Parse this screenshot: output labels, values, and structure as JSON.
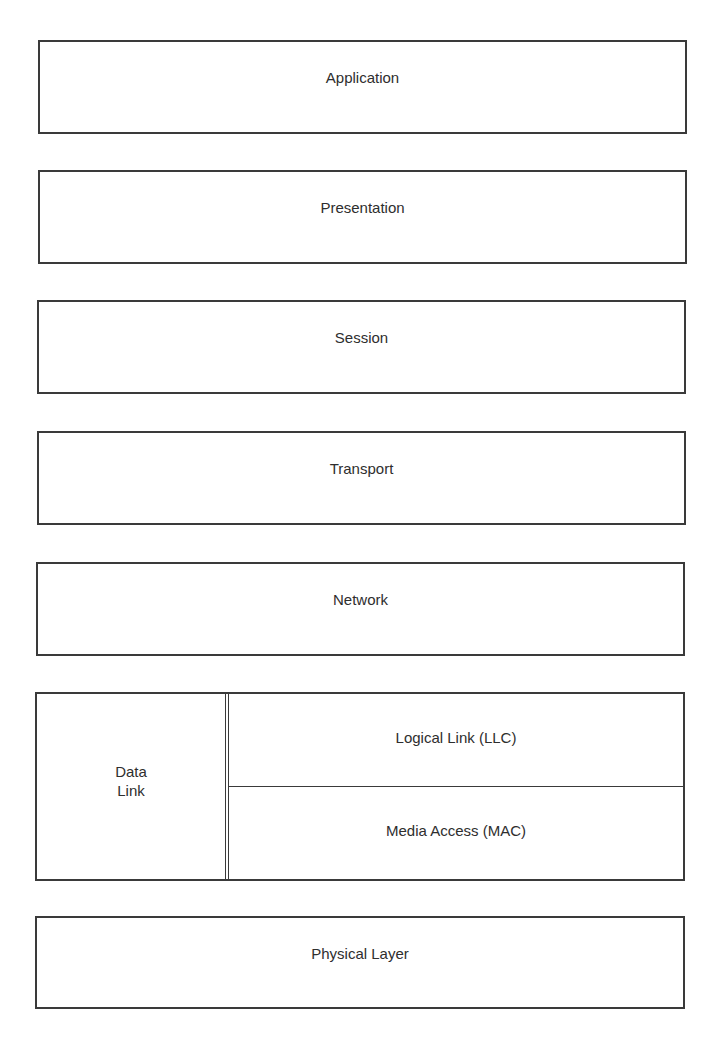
{
  "diagram": {
    "colors": {
      "line": "#3a3a3a",
      "text": "#2e2e2e",
      "background": "#ffffff"
    },
    "layers": [
      {
        "id": "application",
        "label": "Application"
      },
      {
        "id": "presentation",
        "label": "Presentation"
      },
      {
        "id": "session",
        "label": "Session"
      },
      {
        "id": "transport",
        "label": "Transport"
      },
      {
        "id": "network",
        "label": "Network"
      },
      {
        "id": "data-link",
        "label_line1": "Data",
        "label_line2": "Link",
        "sublayers": [
          {
            "id": "llc",
            "label": "Logical Link (LLC)"
          },
          {
            "id": "mac",
            "label": "Media Access (MAC)"
          }
        ]
      },
      {
        "id": "physical",
        "label": "Physical Layer"
      }
    ]
  }
}
